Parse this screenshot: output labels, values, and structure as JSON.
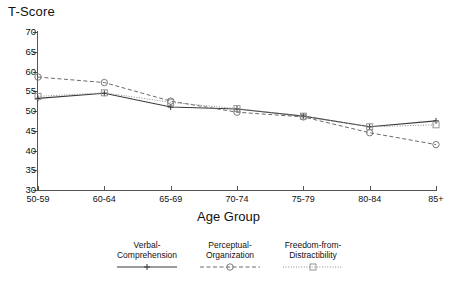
{
  "chart_data": {
    "type": "line",
    "title": "",
    "ylabel": "T-Score",
    "xlabel": "Age Group",
    "categories": [
      "50-59",
      "60-64",
      "65-69",
      "70-74",
      "75-79",
      "80-84",
      "85+"
    ],
    "yticks": [
      30,
      35,
      40,
      45,
      50,
      55,
      60,
      65,
      70
    ],
    "ylim": [
      30,
      70
    ],
    "grid": false,
    "legend_position": "bottom",
    "series": [
      {
        "name": "Verbal-Comprehension",
        "marker": "cross",
        "line_style": "solid",
        "values": [
          53.2,
          54.5,
          51.0,
          50.5,
          48.7,
          46.0,
          47.5
        ]
      },
      {
        "name": "Perceptual-Organization",
        "marker": "circle",
        "line_style": "dashed",
        "values": [
          58.6,
          57.2,
          52.5,
          49.7,
          48.5,
          44.5,
          41.5
        ]
      },
      {
        "name": "Freedom-from-Distractibility",
        "marker": "square",
        "line_style": "dotted",
        "values": [
          53.7,
          54.6,
          52.2,
          50.6,
          48.7,
          46.0,
          46.5
        ]
      }
    ]
  },
  "legend": [
    {
      "line1": "Verbal-",
      "line2": "Comprehension"
    },
    {
      "line1": "Perceptual-",
      "line2": "Organization"
    },
    {
      "line1": "Freedom-from-",
      "line2": "Distractibility"
    }
  ],
  "axis": {
    "y_title": "T-Score",
    "x_title": "Age Group"
  }
}
